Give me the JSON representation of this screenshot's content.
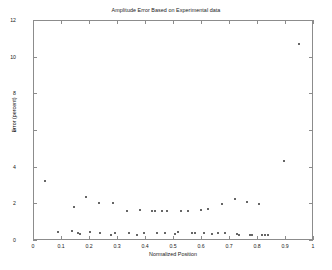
{
  "chart_data": {
    "type": "scatter",
    "title": "Amplitude Error Based on Experimental data",
    "xlabel": "Normalized Position",
    "ylabel": "Error (percent)",
    "xlim": [
      0,
      1
    ],
    "ylim": [
      0,
      12
    ],
    "xticks": [
      "0",
      "0.1",
      "0.2",
      "0.3",
      "0.4",
      "0.5",
      "0.6",
      "0.7",
      "0.8",
      "0.9",
      "1"
    ],
    "xtick_values": [
      0,
      0.1,
      0.2,
      0.3,
      0.4,
      0.5,
      0.6,
      0.7,
      0.8,
      0.9,
      1
    ],
    "yticks": [
      "0",
      "2",
      "4",
      "6",
      "8",
      "10",
      "12"
    ],
    "ytick_values": [
      0,
      2,
      4,
      6,
      8,
      10,
      12
    ],
    "grid": false,
    "legend": null,
    "marker": "dot",
    "marker_color": "#333333",
    "series": [
      {
        "name": "Amplitude Error",
        "x": [
          0.043,
          0.09,
          0.141,
          0.146,
          0.159,
          0.168,
          0.191,
          0.203,
          0.236,
          0.24,
          0.277,
          0.286,
          0.292,
          0.335,
          0.342,
          0.372,
          0.381,
          0.396,
          0.424,
          0.436,
          0.444,
          0.461,
          0.47,
          0.477,
          0.506,
          0.519,
          0.527,
          0.555,
          0.569,
          0.577,
          0.601,
          0.611,
          0.625,
          0.638,
          0.661,
          0.676,
          0.684,
          0.721,
          0.729,
          0.737,
          0.764,
          0.775,
          0.781,
          0.806,
          0.819,
          0.829,
          0.84,
          0.898,
          0.949
        ],
        "y": [
          3.2,
          0.41,
          0.47,
          1.82,
          0.4,
          0.35,
          2.35,
          0.41,
          2.0,
          0.4,
          0.28,
          2.02,
          0.39,
          1.6,
          0.4,
          0.25,
          1.64,
          0.38,
          1.58,
          1.58,
          0.38,
          1.58,
          0.37,
          1.58,
          0.34,
          0.42,
          1.6,
          1.6,
          0.4,
          0.36,
          1.62,
          0.38,
          1.67,
          0.34,
          0.36,
          1.96,
          0.36,
          2.24,
          0.31,
          0.26,
          2.06,
          0.3,
          0.28,
          1.96,
          0.3,
          0.29,
          0.28,
          4.32,
          10.68
        ]
      }
    ]
  }
}
